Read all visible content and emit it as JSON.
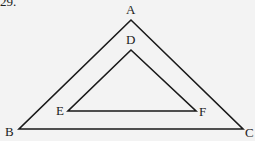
{
  "question_number": "29.",
  "diagram": {
    "type": "nested-triangles",
    "outer_triangle": {
      "vertices": [
        {
          "label": "A",
          "x": 131,
          "y": 20
        },
        {
          "label": "B",
          "x": 19,
          "y": 129
        },
        {
          "label": "C",
          "x": 243,
          "y": 129
        }
      ]
    },
    "inner_triangle": {
      "vertices": [
        {
          "label": "D",
          "x": 131,
          "y": 50
        },
        {
          "label": "E",
          "x": 68,
          "y": 111
        },
        {
          "label": "F",
          "x": 196,
          "y": 111
        }
      ]
    },
    "stroke_color": "#1a1a1a",
    "background_color": "#f3f3f3"
  },
  "labels": {
    "A": "A",
    "B": "B",
    "C": "C",
    "D": "D",
    "E": "E",
    "F": "F"
  }
}
